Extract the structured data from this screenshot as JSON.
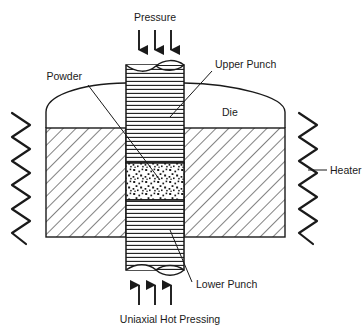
{
  "figure": {
    "title": "Uniaxial Hot Pressing",
    "kind": "technical-schematic",
    "background_color": "#ffffff",
    "line_color": "#1a1a1a",
    "border": "none"
  },
  "labels": {
    "pressure": "Pressure",
    "upper_punch": "Upper Punch",
    "die": "Die",
    "heater": "Heater",
    "powder": "Powder",
    "lower_punch": "Lower Punch",
    "caption": "Uniaxial Hot Pressing"
  },
  "parts": [
    {
      "id": "upper-punch",
      "label": "Upper Punch",
      "hatch": "horizontal-lines",
      "end_style": "broken-cylinder-ellipse",
      "position": "top-center"
    },
    {
      "id": "powder",
      "label": "Powder",
      "hatch": "stipple-dots",
      "position": "center"
    },
    {
      "id": "lower-punch",
      "label": "Lower Punch",
      "hatch": "horizontal-lines",
      "end_style": "broken-cylinder-ellipse",
      "position": "bottom-center"
    },
    {
      "id": "die-left",
      "label": "Die",
      "hatch": "diagonal-lines-45",
      "position": "left"
    },
    {
      "id": "die-right",
      "label": "Die",
      "hatch": "diagonal-lines-45",
      "position": "right"
    },
    {
      "id": "heater-left",
      "label": "Heater",
      "shape": "vertical-zigzag",
      "position": "far-left"
    },
    {
      "id": "heater-right",
      "label": "Heater",
      "shape": "vertical-zigzag",
      "position": "far-right"
    }
  ],
  "arrows": {
    "top": {
      "label": "Pressure",
      "direction": "down",
      "count": 3
    },
    "bottom": {
      "label": "Uniaxial Hot Pressing",
      "direction": "up",
      "count": 3
    }
  },
  "colors": {
    "ink": "#1a1a1a",
    "paper": "#ffffff"
  }
}
